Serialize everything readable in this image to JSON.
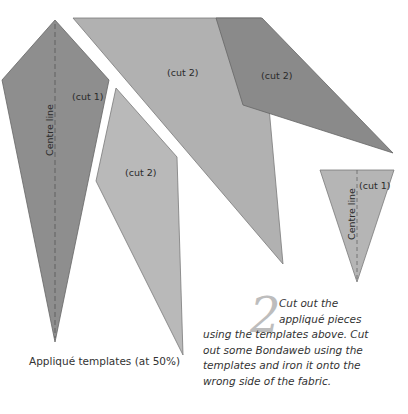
{
  "templates": {
    "pieces": [
      {
        "id": "left-kite",
        "label": "(cut 1)",
        "centre_line_label": "Centre line",
        "fill": "#8e8e8e"
      },
      {
        "id": "middle-diamond",
        "label": "(cut 2)",
        "fill": "#b9b9b9"
      },
      {
        "id": "large-triangle",
        "label": "(cut 2)",
        "fill": "#b1b1b1"
      },
      {
        "id": "dark-quad",
        "label": "(cut 2)",
        "fill": "#8a8a8a"
      },
      {
        "id": "small-triangle",
        "label": "(cut 1)",
        "centre_line_label": "Centre line",
        "fill": "#b5b5b5"
      }
    ],
    "caption": "Appliqué templates (at 50%)"
  },
  "instruction": {
    "step_number": "2",
    "lines": [
      "Cut out the",
      "appliqué pieces",
      "using the templates above. Cut",
      "out some Bondaweb using the",
      "templates and iron it onto the",
      "wrong side of the fabric."
    ]
  }
}
